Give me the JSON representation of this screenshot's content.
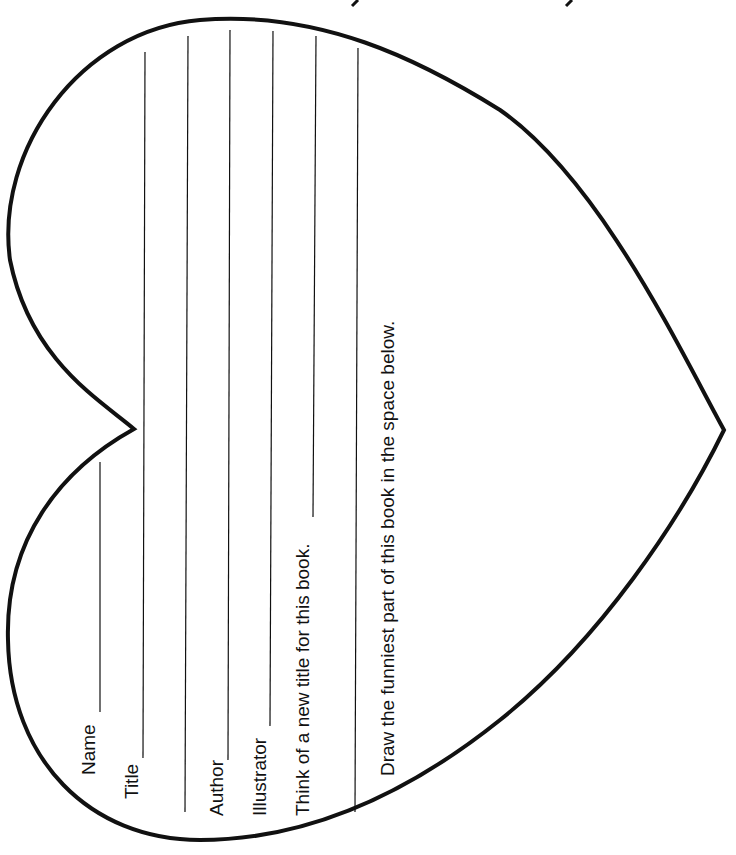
{
  "worksheet": {
    "shape": "heart",
    "stroke_color": "#111111",
    "fields": [
      {
        "label": "Name"
      },
      {
        "label": "Title"
      },
      {
        "label": "Author"
      },
      {
        "label": "Illustrator"
      }
    ],
    "prompts": {
      "new_title": "Think of a new title for this book.",
      "draw": "Draw the funniest part of this book in the space below."
    }
  }
}
